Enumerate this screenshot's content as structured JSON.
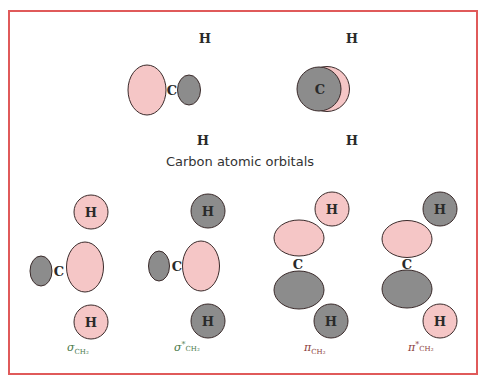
{
  "colors": {
    "border": "#e05a5a",
    "positive_lobe": "#f5c6c6",
    "negative_lobe": "#8c8c8c",
    "outline": "#3a2a2a",
    "sigma_label": "#4a7a4a",
    "pi_label": "#8a3a3a"
  },
  "atomic_orbitals": {
    "caption": "Carbon atomic orbitals",
    "diagram_1": {
      "carbon": "C",
      "h_top": "H",
      "h_bottom": "H"
    },
    "diagram_2": {
      "carbon": "C",
      "h_top": "H",
      "h_bottom": "H"
    }
  },
  "molecular_orbitals": [
    {
      "name": "sigma",
      "symbol": "σ",
      "star": "",
      "subscript": "CH₂",
      "carbon": "C",
      "h_top": "H",
      "h_bottom": "H",
      "h_top_phase": "positive",
      "h_bottom_phase": "positive"
    },
    {
      "name": "sigma-star",
      "symbol": "σ",
      "star": "*",
      "subscript": "CH₂",
      "carbon": "C",
      "h_top": "H",
      "h_bottom": "H",
      "h_top_phase": "negative",
      "h_bottom_phase": "negative"
    },
    {
      "name": "pi",
      "symbol": "π",
      "star": "",
      "subscript": "CH₂",
      "carbon": "C",
      "h_top": "H",
      "h_bottom": "H",
      "h_top_phase": "positive",
      "h_bottom_phase": "negative"
    },
    {
      "name": "pi-star",
      "symbol": "π",
      "star": "*",
      "subscript": "CH₂",
      "carbon": "C",
      "h_top": "H",
      "h_bottom": "H",
      "h_top_phase": "negative",
      "h_bottom_phase": "positive"
    }
  ]
}
